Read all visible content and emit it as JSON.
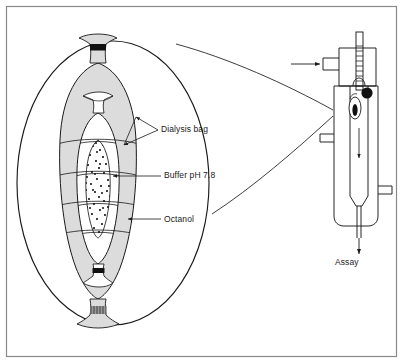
{
  "figure": {
    "frame_color": "#8a8a8a",
    "line_color": "#1a1a1a",
    "octanol_fill": "#dcdcdc",
    "bag_fill": "#ffffff",
    "clip_dark": "#111111",
    "clip_hatch": "#9a9a9a",
    "background": "#ffffff"
  },
  "labels": {
    "dialysis_bag": "Dialysis bag",
    "buffer": "Buffer pH 7.8",
    "octanol": "Octanol",
    "assay": "Assay"
  },
  "icons": {
    "inlet_arrow": "arrow-right-icon",
    "flow_arrow": "arrow-down-icon",
    "assay_arrow": "arrow-down-icon",
    "leader_dialysis": "forked-leader-icon",
    "leader_buffer": "leader-arrow-icon",
    "leader_octanol": "leader-arrow-icon"
  },
  "apparatus": {
    "thermometer": "thermometer-icon",
    "thermometer_graduations": 9,
    "bulb": "thermometer-bulb-icon",
    "capsule": "dialysis-capsule-icon",
    "vessel": "jacketed-vessel-icon",
    "inlet_port": "inlet-port-icon",
    "outlet_port": "outlet-port-icon"
  },
  "magnification": {
    "cone": "magnification-cone-icon",
    "lens": "magnified-ellipse-icon"
  },
  "buffer_dots": 46
}
